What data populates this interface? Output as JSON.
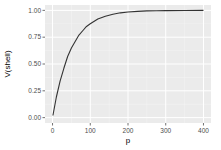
{
  "chart_data": {
    "type": "line",
    "title": "",
    "xlabel": "p",
    "ylabel": "V(shell)",
    "xlim": [
      -20,
      420
    ],
    "ylim": [
      -0.05,
      1.05
    ],
    "x_ticks": [
      0,
      100,
      200,
      300,
      400
    ],
    "x_tick_labels": [
      "0",
      "100",
      "200",
      "300",
      "400"
    ],
    "y_ticks": [
      0,
      0.25,
      0.5,
      0.75,
      1.0
    ],
    "y_tick_labels": [
      "0.00",
      "0.25",
      "0.50",
      "0.75",
      "1.00"
    ],
    "grid": true,
    "legend": "none",
    "series": [
      {
        "name": "V(shell)",
        "color": "#333333",
        "x": [
          1,
          10,
          20,
          30,
          40,
          50,
          60,
          70,
          80,
          90,
          100,
          120,
          140,
          160,
          180,
          200,
          225,
          250,
          275,
          300,
          350,
          400
        ],
        "y": [
          0.02,
          0.19,
          0.34,
          0.46,
          0.57,
          0.65,
          0.71,
          0.77,
          0.81,
          0.85,
          0.875,
          0.92,
          0.946,
          0.964,
          0.977,
          0.985,
          0.991,
          0.995,
          0.997,
          0.998,
          0.999,
          1.0
        ]
      }
    ],
    "colors": {
      "panel_background": "#ebebeb",
      "grid_major": "#ffffff",
      "line": "#333333"
    }
  }
}
